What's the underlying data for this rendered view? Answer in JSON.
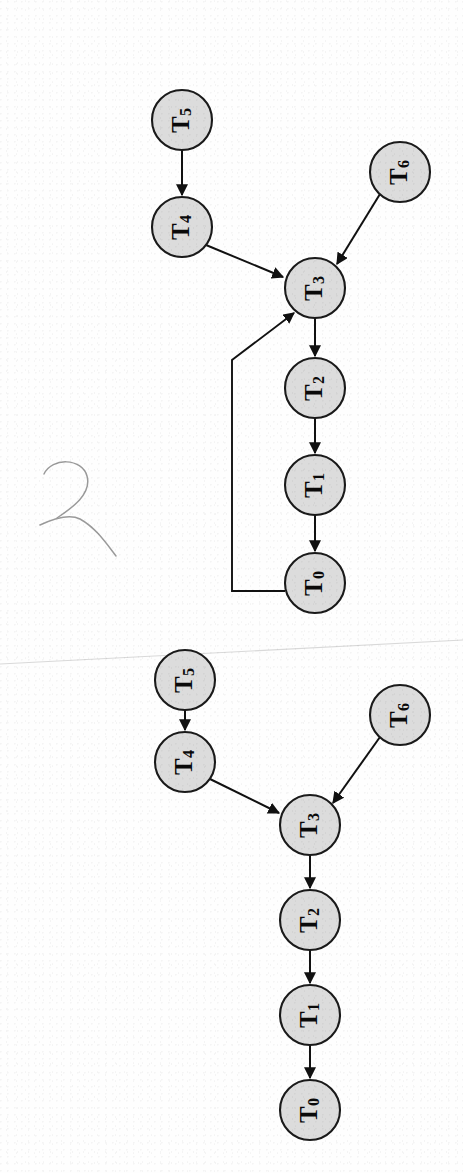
{
  "page": {
    "width": 463,
    "height": 1173,
    "background_color": "#fefefe"
  },
  "style": {
    "node_fill": "#dcdcdc",
    "node_stroke": "#1a1a1a",
    "edge_color": "#111111",
    "node_radius": 30,
    "seam_color": "#d9d9d9",
    "hair_color": "#9a9a9a"
  },
  "artifacts": {
    "scan_seam_label": "scan-seam",
    "hair_mark_label": "scanner-hair-artifact"
  },
  "diagrams": [
    {
      "id": "upper-graph",
      "name": "Task graph with feedback edge",
      "has_feedback_edge": true,
      "nodes": [
        {
          "id": "u-t5",
          "base": "T",
          "sub": "5",
          "label": "T5",
          "cx": 182,
          "cy": 120
        },
        {
          "id": "u-t4",
          "base": "T",
          "sub": "4",
          "label": "T4",
          "cx": 182,
          "cy": 227
        },
        {
          "id": "u-t6",
          "base": "T",
          "sub": "6",
          "label": "T6",
          "cx": 400,
          "cy": 172
        },
        {
          "id": "u-t3",
          "base": "T",
          "sub": "3",
          "label": "T3",
          "cx": 315,
          "cy": 288
        },
        {
          "id": "u-t2",
          "base": "T",
          "sub": "2",
          "label": "T2",
          "cx": 315,
          "cy": 388
        },
        {
          "id": "u-t1",
          "base": "T",
          "sub": "1",
          "label": "T1",
          "cx": 315,
          "cy": 485
        },
        {
          "id": "u-t0",
          "base": "T",
          "sub": "0",
          "label": "T0",
          "cx": 315,
          "cy": 583
        }
      ],
      "edges": [
        {
          "id": "u-e-t5-t4",
          "from": "T5",
          "to": "T4",
          "kind": "straight"
        },
        {
          "id": "u-e-t4-t3",
          "from": "T4",
          "to": "T3",
          "kind": "straight"
        },
        {
          "id": "u-e-t6-t3",
          "from": "T6",
          "to": "T3",
          "kind": "straight"
        },
        {
          "id": "u-e-t3-t2",
          "from": "T3",
          "to": "T2",
          "kind": "straight"
        },
        {
          "id": "u-e-t2-t1",
          "from": "T2",
          "to": "T1",
          "kind": "straight"
        },
        {
          "id": "u-e-t1-t0",
          "from": "T1",
          "to": "T0",
          "kind": "straight"
        },
        {
          "id": "u-e-t0-t3",
          "from": "T0",
          "to": "T3",
          "kind": "feedback-loop"
        }
      ]
    },
    {
      "id": "lower-graph",
      "name": "Task graph without feedback edge",
      "has_feedback_edge": false,
      "nodes": [
        {
          "id": "l-t5",
          "base": "T",
          "sub": "5",
          "label": "T5",
          "cx": 185,
          "cy": 680
        },
        {
          "id": "l-t4",
          "base": "T",
          "sub": "4",
          "label": "T4",
          "cx": 185,
          "cy": 762
        },
        {
          "id": "l-t6",
          "base": "T",
          "sub": "6",
          "label": "T6",
          "cx": 400,
          "cy": 715
        },
        {
          "id": "l-t3",
          "base": "T",
          "sub": "3",
          "label": "T3",
          "cx": 310,
          "cy": 825
        },
        {
          "id": "l-t2",
          "base": "T",
          "sub": "2",
          "label": "T2",
          "cx": 310,
          "cy": 920
        },
        {
          "id": "l-t1",
          "base": "T",
          "sub": "1",
          "label": "T1",
          "cx": 310,
          "cy": 1015
        },
        {
          "id": "l-t0",
          "base": "T",
          "sub": "0",
          "label": "T0",
          "cx": 310,
          "cy": 1110
        }
      ],
      "edges": [
        {
          "id": "l-e-t5-t4",
          "from": "T5",
          "to": "T4",
          "kind": "straight"
        },
        {
          "id": "l-e-t4-t3",
          "from": "T4",
          "to": "T3",
          "kind": "straight"
        },
        {
          "id": "l-e-t6-t3",
          "from": "T6",
          "to": "T3",
          "kind": "straight"
        },
        {
          "id": "l-e-t3-t2",
          "from": "T3",
          "to": "T2",
          "kind": "straight"
        },
        {
          "id": "l-e-t2-t1",
          "from": "T2",
          "to": "T1",
          "kind": "straight"
        },
        {
          "id": "l-e-t1-t0",
          "from": "T1",
          "to": "T0",
          "kind": "straight"
        }
      ]
    }
  ]
}
